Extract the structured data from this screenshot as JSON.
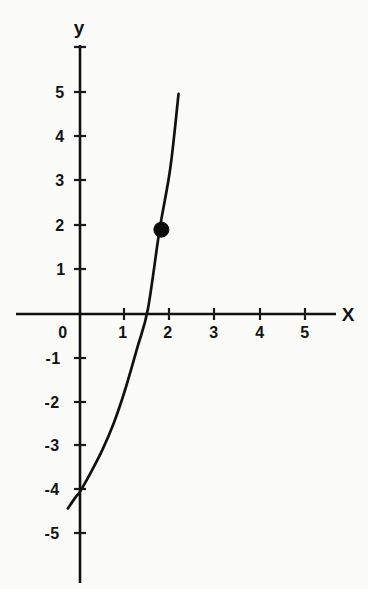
{
  "chart_data": {
    "type": "line",
    "title": "",
    "xlabel": "x",
    "ylabel": "y",
    "xlim": [
      -0.6,
      5.7
    ],
    "ylim": [
      -5.6,
      5.6
    ],
    "grid": false,
    "legend": null,
    "xticks": [
      0,
      1,
      2,
      3,
      4,
      5
    ],
    "xtick_labels": [
      "0",
      "1",
      "2",
      "3",
      "4",
      "5"
    ],
    "yticks": [
      5,
      4,
      3,
      2,
      1,
      -1,
      -2,
      -3,
      -4,
      -5
    ],
    "ytick_labels": [
      "5",
      "4",
      "3",
      "2",
      "1",
      "-1",
      "-2",
      "-3",
      "-4",
      "-5"
    ],
    "series": [
      {
        "name": "exponential curve",
        "description": "increasing exponential curve crossing y-axis near y = -4 and x-axis near x = 1.3",
        "x": [
          -0.27,
          -0.1,
          0.0,
          0.25,
          0.5,
          0.75,
          1.0,
          1.27,
          1.5,
          1.76,
          2.0,
          2.18
        ],
        "y": [
          -4.38,
          -4.13,
          -4.0,
          -3.55,
          -3.05,
          -2.45,
          -1.7,
          -0.75,
          0.1,
          1.89,
          3.3,
          4.96
        ]
      }
    ],
    "annotations": [
      {
        "type": "point",
        "label": "",
        "x": 1.8,
        "y": 1.9,
        "marker": "filled-circle"
      }
    ]
  },
  "axes": {
    "x_axis_name": "X",
    "y_axis_name": "y",
    "origin_label": "0"
  },
  "colors": {
    "background": "#fbfbfa",
    "ink": "#111111",
    "marker": "#0d0d0d"
  }
}
